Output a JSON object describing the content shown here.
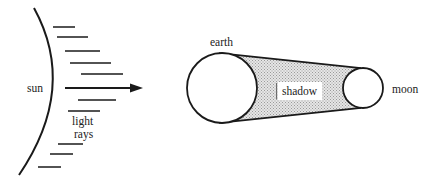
{
  "diagram": {
    "type": "lunar-eclipse-schematic",
    "colors": {
      "stroke": "#1a1a1a",
      "shadow_fill": "#cfcfcf",
      "background": "#ffffff"
    },
    "labels": {
      "sun": "sun",
      "light_rays_line1": "light",
      "light_rays_line2": "rays",
      "earth": "earth",
      "shadow": "shadow",
      "moon": "moon"
    },
    "sun": {
      "arc": "curved edge at left"
    },
    "light_rays": [
      {
        "y": 27,
        "x1": 53,
        "x2": 75
      },
      {
        "y": 37,
        "x1": 57,
        "x2": 88
      },
      {
        "y": 51,
        "x1": 65,
        "x2": 100
      },
      {
        "y": 63,
        "x1": 70,
        "x2": 111
      },
      {
        "y": 74,
        "x1": 81,
        "x2": 123
      },
      {
        "y": 100,
        "x1": 78,
        "x2": 116
      },
      {
        "y": 111,
        "x1": 68,
        "x2": 100
      },
      {
        "y": 144,
        "x1": 58,
        "x2": 83
      },
      {
        "y": 154,
        "x1": 50,
        "x2": 73
      },
      {
        "y": 167,
        "x1": 38,
        "x2": 61
      }
    ],
    "main_arrow": {
      "y": 88,
      "x1": 65,
      "x2": 142
    },
    "earth": {
      "cx": 222,
      "cy": 88,
      "r": 35
    },
    "moon": {
      "cx": 363,
      "cy": 88,
      "r": 20
    }
  }
}
